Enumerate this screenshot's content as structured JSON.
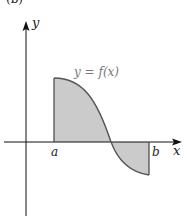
{
  "figure": {
    "panel_label": "(b)",
    "curve_label": "y = f(x)",
    "axis_labels": {
      "x": "x",
      "y": "y"
    },
    "interval_labels": {
      "a": "a",
      "b": "b"
    }
  },
  "colors": {
    "axis": "#111111",
    "curve": "#555555",
    "fill": "#cbcbcb",
    "curve_label": "#777777"
  },
  "geometry": {
    "origin_px": [
      26,
      142
    ],
    "a_px": 54,
    "b_px": 149,
    "zero_crossing_px": 111,
    "curve_top_px": [
      54,
      78
    ],
    "curve_bottom_px": [
      149,
      175
    ]
  }
}
